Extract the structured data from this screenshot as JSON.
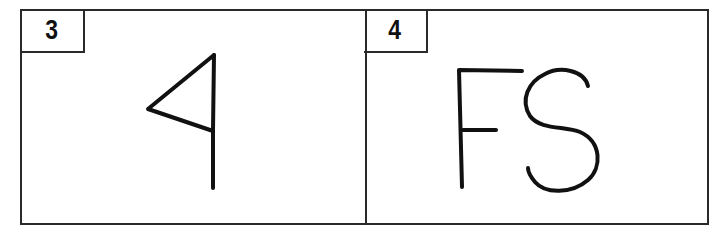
{
  "panels": [
    {
      "label": "3",
      "drawing": "triangle-flag-symbol"
    },
    {
      "label": "4",
      "drawing": "handwritten-letters",
      "text": "FS"
    }
  ],
  "colors": {
    "stroke": "#111111",
    "border": "#2a2a2a",
    "background": "#ffffff"
  }
}
